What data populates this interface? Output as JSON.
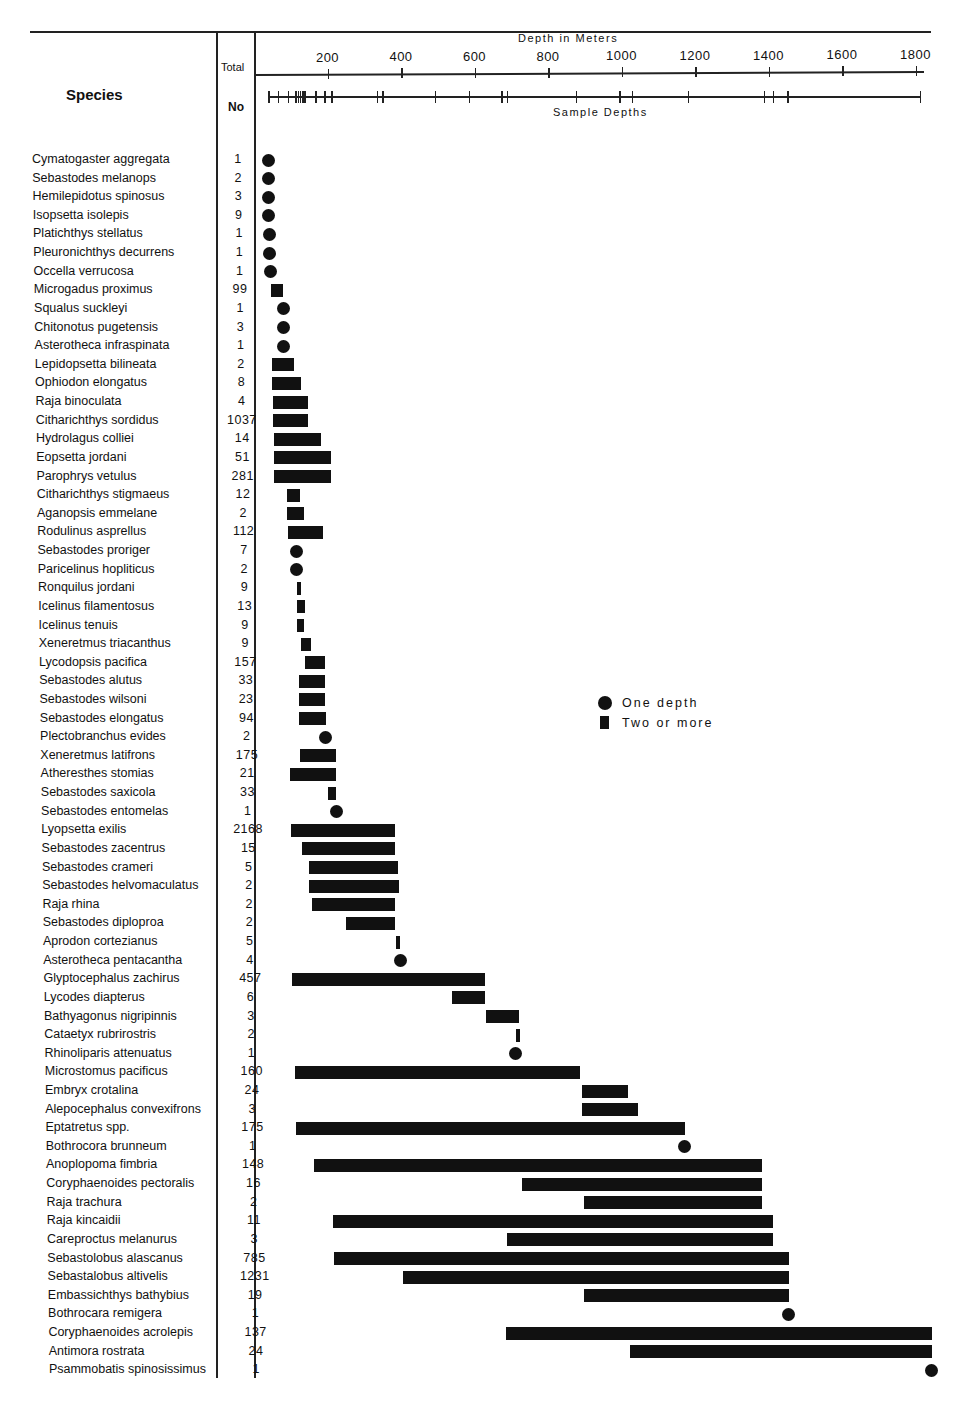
{
  "header": {
    "species_label": "Species",
    "total_label": "Total",
    "no_label": "No",
    "axis_title": "Depth in Meters",
    "sample_depths_label": "Sample Depths"
  },
  "legend": {
    "one_depth": "One depth",
    "two_or_more": "Two or more"
  },
  "colors": {
    "ink": "#111111",
    "background": "#ffffff"
  },
  "chart_data": {
    "type": "range-bar",
    "title": "Depth in Meters",
    "xlabel": "Depth in Meters",
    "ylabel": "Species",
    "xlim": [
      0,
      1850
    ],
    "x_ticks": [
      200,
      400,
      600,
      800,
      1000,
      1200,
      1400,
      1600,
      1800
    ],
    "sample_depths": [
      0,
      27,
      55,
      75,
      82,
      88,
      94,
      100,
      130,
      155,
      175,
      300,
      315,
      460,
      555,
      645,
      660,
      850,
      970,
      1005,
      1160,
      1370,
      1395,
      1435,
      1800
    ],
    "legend": [
      {
        "marker": "circle",
        "label": "One depth"
      },
      {
        "marker": "bar",
        "label": "Two or more"
      }
    ],
    "grid": false,
    "rows": [
      {
        "species": "Cymatogaster aggregata",
        "total": "1",
        "min": 44,
        "max": 44
      },
      {
        "species": "Sebastodes melanops",
        "total": "2",
        "min": 44,
        "max": 44
      },
      {
        "species": "Hemilepidotus spinosus",
        "total": "3",
        "min": 46,
        "max": 46
      },
      {
        "species": "Isopsetta isolepis",
        "total": "9",
        "min": 46,
        "max": 46
      },
      {
        "species": "Platichthys stellatus",
        "total": "1",
        "min": 48,
        "max": 48
      },
      {
        "species": "Pleuronichthys decurrens",
        "total": "1",
        "min": 48,
        "max": 48
      },
      {
        "species": "Occella verrucosa",
        "total": "1",
        "min": 50,
        "max": 50
      },
      {
        "species": "Microgadus proximus",
        "total": "99",
        "min": 52,
        "max": 84
      },
      {
        "species": "Squalus suckleyi",
        "total": "1",
        "min": 87,
        "max": 87
      },
      {
        "species": "Chitonotus pugetensis",
        "total": "3",
        "min": 87,
        "max": 87
      },
      {
        "species": "Asterotheca infraspinata",
        "total": "1",
        "min": 87,
        "max": 87
      },
      {
        "species": "Lepidopsetta bilineata",
        "total": "2",
        "min": 54,
        "max": 114
      },
      {
        "species": "Ophiodon elongatus",
        "total": "8",
        "min": 54,
        "max": 133
      },
      {
        "species": "Raja binoculata",
        "total": "4",
        "min": 57,
        "max": 152
      },
      {
        "species": "Citharichthys sordidus",
        "total": "1037",
        "min": 57,
        "max": 152
      },
      {
        "species": "Hydrolagus colliei",
        "total": "14",
        "min": 60,
        "max": 188
      },
      {
        "species": "Eopsetta jordani",
        "total": "51",
        "min": 60,
        "max": 215
      },
      {
        "species": "Parophrys vetulus",
        "total": "281",
        "min": 60,
        "max": 215
      },
      {
        "species": "Citharichthys stigmaeus",
        "total": "12",
        "min": 95,
        "max": 131
      },
      {
        "species": "Aganopsis emmelane",
        "total": "2",
        "min": 95,
        "max": 141
      },
      {
        "species": "Rodulinus asprellus",
        "total": "112",
        "min": 98,
        "max": 193
      },
      {
        "species": "Sebastodes proriger",
        "total": "7",
        "min": 120,
        "max": 120
      },
      {
        "species": "Paricelinus hopliticus",
        "total": "2",
        "min": 120,
        "max": 120
      },
      {
        "species": "Ronquilus jordani",
        "total": "9",
        "min": 122,
        "max": 131
      },
      {
        "species": "Icelinus filamentosus",
        "total": "13",
        "min": 122,
        "max": 144
      },
      {
        "species": "Icelinus tenuis",
        "total": "9",
        "min": 122,
        "max": 141
      },
      {
        "species": "Xeneretmus triacanthus",
        "total": "9",
        "min": 133,
        "max": 160
      },
      {
        "species": "Lycodopsis pacifica",
        "total": "157",
        "min": 144,
        "max": 199
      },
      {
        "species": "Sebastodes alutus",
        "total": "33",
        "min": 128,
        "max": 199
      },
      {
        "species": "Sebastodes wilsoni",
        "total": "23",
        "min": 128,
        "max": 199
      },
      {
        "species": "Sebastodes elongatus",
        "total": "94",
        "min": 128,
        "max": 201
      },
      {
        "species": "Plectobranchus evides",
        "total": "2",
        "min": 201,
        "max": 201
      },
      {
        "species": "Xeneretmus latifrons",
        "total": "175",
        "min": 131,
        "max": 229
      },
      {
        "species": "Atheresthes stomias",
        "total": "21",
        "min": 103,
        "max": 229
      },
      {
        "species": "Sebastodes saxicola",
        "total": "33",
        "min": 207,
        "max": 229
      },
      {
        "species": "Sebastodes entomelas",
        "total": "1",
        "min": 229,
        "max": 229
      },
      {
        "species": "Lyopsetta exilis",
        "total": "2168",
        "min": 106,
        "max": 389
      },
      {
        "species": "Sebastodes zacentrus",
        "total": "15",
        "min": 136,
        "max": 389
      },
      {
        "species": "Sebastodes crameri",
        "total": "5",
        "min": 155,
        "max": 397
      },
      {
        "species": "Sebastodes helvomaculatus",
        "total": "2",
        "min": 155,
        "max": 400
      },
      {
        "species": "Raja rhina",
        "total": "2",
        "min": 163,
        "max": 389
      },
      {
        "species": "Sebastodes diploproa",
        "total": "2",
        "min": 256,
        "max": 389
      },
      {
        "species": "Aprodon cortezianus",
        "total": "5",
        "min": 392,
        "max": 400
      },
      {
        "species": "Asterotheca pentacantha",
        "total": "4",
        "min": 405,
        "max": 405
      },
      {
        "species": "Glyptocephalus zachirus",
        "total": "457",
        "min": 109,
        "max": 634
      },
      {
        "species": "Lycodes diapterus",
        "total": "6",
        "min": 544,
        "max": 634
      },
      {
        "species": "Bathyagonus nigripinnis",
        "total": "3",
        "min": 637,
        "max": 727
      },
      {
        "species": "Cataetyx rubrirostris",
        "total": "2",
        "min": 718,
        "max": 727
      },
      {
        "species": "Rhinoliparis attenuatus",
        "total": "1",
        "min": 716,
        "max": 716
      },
      {
        "species": "Microstomus pacificus",
        "total": "160",
        "min": 117,
        "max": 893
      },
      {
        "species": "Embryx crotalina",
        "total": "24",
        "min": 898,
        "max": 1023
      },
      {
        "species": "Alepocephalus convexifrons",
        "total": "3",
        "min": 898,
        "max": 1050
      },
      {
        "species": "Eptatretus spp.",
        "total": "175",
        "min": 120,
        "max": 1178
      },
      {
        "species": "Bothrocora brunneum",
        "total": "1",
        "min": 1176,
        "max": 1176
      },
      {
        "species": "Anoplopoma fimbria",
        "total": "148",
        "min": 169,
        "max": 1388
      },
      {
        "species": "Coryphaenoides pectoralis",
        "total": "16",
        "min": 735,
        "max": 1388
      },
      {
        "species": "Raja trachura",
        "total": "2",
        "min": 903,
        "max": 1388
      },
      {
        "species": "Raja kincaidii",
        "total": "11",
        "min": 220,
        "max": 1418
      },
      {
        "species": "Careproctus melanurus",
        "total": "3",
        "min": 694,
        "max": 1418
      },
      {
        "species": "Sebastolobus alascanus",
        "total": "785",
        "min": 223,
        "max": 1461
      },
      {
        "species": "Sebastalobus altivelis",
        "total": "1231",
        "min": 411,
        "max": 1461
      },
      {
        "species": "Embassichthys bathybius",
        "total": "19",
        "min": 903,
        "max": 1461
      },
      {
        "species": "Bothrocara remigera",
        "total": "1",
        "min": 1461,
        "max": 1461
      },
      {
        "species": "Coryphaenoides acrolepis",
        "total": "137",
        "min": 691,
        "max": 1850
      },
      {
        "species": "Antimora rostrata",
        "total": "24",
        "min": 1029,
        "max": 1850
      },
      {
        "species": "Psammobatis spinosissimus",
        "total": "1",
        "min": 1850,
        "max": 1850
      }
    ]
  }
}
